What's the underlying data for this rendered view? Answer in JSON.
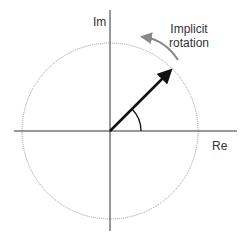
{
  "diagram": {
    "axes": {
      "x_label": "Re",
      "y_label": "Im"
    },
    "annotation": {
      "line1": "Implicit",
      "line2": "rotation"
    },
    "colors": {
      "axis": "#333333",
      "circle": "#9a9a9a",
      "vector": "#111111",
      "rotation_arrow": "#888888"
    },
    "unit_circle": {
      "center": [
        110,
        131
      ],
      "radius": 88
    },
    "vector_angle_deg": 45
  }
}
